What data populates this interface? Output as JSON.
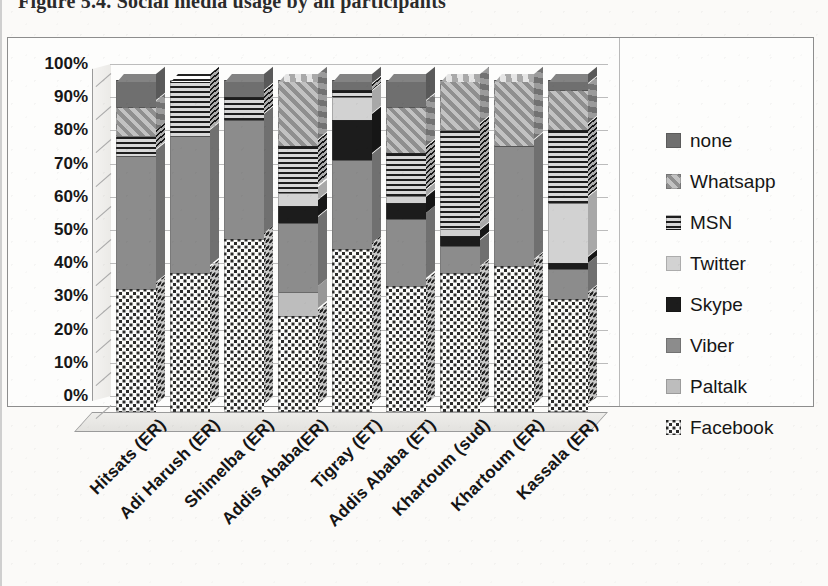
{
  "figure": {
    "title": "Figure 5.4. Social media usage by all participants"
  },
  "chart_data": {
    "type": "bar",
    "subtype": "stacked-percentage-3d",
    "title": "Figure 5.4. Social media usage by all participants",
    "xlabel": "",
    "ylabel": "",
    "ylim": [
      0,
      100
    ],
    "yticks": [
      "0%",
      "10%",
      "20%",
      "30%",
      "40%",
      "50%",
      "60%",
      "70%",
      "80%",
      "90%",
      "100%"
    ],
    "grid": true,
    "legend_position": "right",
    "stack_order_bottom_to_top": [
      "Facebook",
      "Paltalk",
      "Viber",
      "Skype",
      "Twitter",
      "MSN",
      "Whatsapp",
      "none"
    ],
    "categories": [
      "Hitsats (ER)",
      "Adi Harush (ER)",
      "Shimelba (ER)",
      "Addis Ababa(ER)",
      "Tigray (ET)",
      "Addis Ababa (ET)",
      "Khartoum  (sud)",
      "Khartoum  (ER)",
      "Kassala (ER)"
    ],
    "series": [
      {
        "name": "Facebook",
        "values": [
          37,
          42,
          52,
          29,
          49,
          38,
          42,
          44,
          34
        ]
      },
      {
        "name": "Paltalk",
        "values": [
          0,
          0,
          0,
          7,
          0,
          0,
          0,
          0,
          0
        ]
      },
      {
        "name": "Viber",
        "values": [
          40,
          41,
          36,
          21,
          27,
          20,
          8,
          36,
          9
        ]
      },
      {
        "name": "Skype",
        "values": [
          0,
          0,
          0,
          5,
          12,
          5,
          3,
          0,
          2
        ]
      },
      {
        "name": "Twitter",
        "values": [
          0,
          0,
          0,
          4,
          7,
          2,
          2,
          0,
          18
        ]
      },
      {
        "name": "MSN",
        "values": [
          6,
          17,
          7,
          14,
          2,
          13,
          30,
          0,
          22
        ]
      },
      {
        "name": "Whatsapp",
        "values": [
          9,
          0,
          0,
          20,
          0,
          14,
          15,
          20,
          12
        ]
      },
      {
        "name": "none",
        "values": [
          8,
          0,
          5,
          0,
          3,
          8,
          0,
          0,
          3
        ]
      }
    ],
    "legend": [
      {
        "label": "none",
        "pattern": "solid-dark-gray",
        "color": "#6f6f6f"
      },
      {
        "label": "Whatsapp",
        "pattern": "diagonal-hatch",
        "color": "#8f8f8f"
      },
      {
        "label": "MSN",
        "pattern": "horizontal-stripes",
        "color": "#1d1d1d"
      },
      {
        "label": "Twitter",
        "pattern": "solid-light-gray",
        "color": "#d2d2d2"
      },
      {
        "label": "Skype",
        "pattern": "solid-black",
        "color": "#1c1c1c"
      },
      {
        "label": "Viber",
        "pattern": "solid-medium-gray",
        "color": "#8c8c8c"
      },
      {
        "label": "Paltalk",
        "pattern": "solid-pale-gray",
        "color": "#bdbdbd"
      },
      {
        "label": "Facebook",
        "pattern": "dotted-stipple",
        "color": "#2a2a2a"
      }
    ]
  }
}
